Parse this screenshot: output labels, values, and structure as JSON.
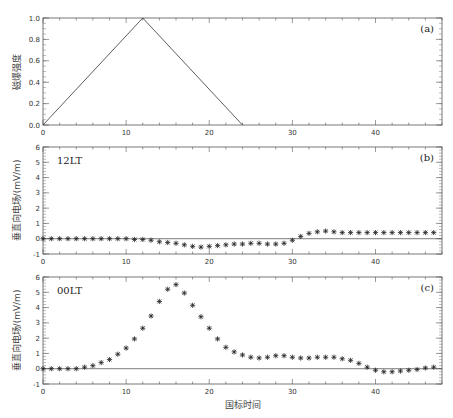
{
  "chart_data": [
    {
      "panel": "a",
      "type": "line",
      "tag": "(a)",
      "title": "",
      "xlabel": "",
      "ylabel": "磁爆强度",
      "xlim": [
        0,
        48
      ],
      "ylim": [
        0.0,
        1.0
      ],
      "xticks": [
        0,
        10,
        20,
        30,
        40
      ],
      "yticks": [
        "0.0",
        "0.2",
        "0.4",
        "0.6",
        "0.8",
        "1.0"
      ],
      "grid": false,
      "series": [
        {
          "name": "storm intensity",
          "x": [
            0,
            12,
            24
          ],
          "y": [
            0.0,
            1.0,
            0.0
          ]
        }
      ]
    },
    {
      "panel": "b",
      "type": "scatter",
      "tag": "(b)",
      "annotation": "12LT",
      "xlabel": "",
      "ylabel": "垂直向电场/(mV/m)",
      "xlim": [
        0,
        48
      ],
      "ylim": [
        -1,
        6
      ],
      "xticks": [
        0,
        10,
        20,
        30,
        40
      ],
      "yticks": [
        "-1",
        "0",
        "1",
        "2",
        "3",
        "4",
        "5",
        "6"
      ],
      "zero_line": true,
      "marker": "asterisk",
      "series": [
        {
          "name": "12LT",
          "x": [
            0,
            1,
            2,
            3,
            4,
            5,
            6,
            7,
            8,
            9,
            10,
            11,
            12,
            13,
            14,
            15,
            16,
            17,
            18,
            19,
            20,
            21,
            22,
            23,
            24,
            25,
            26,
            27,
            28,
            29,
            30,
            31,
            32,
            33,
            34,
            35,
            36,
            37,
            38,
            39,
            40,
            41,
            42,
            43,
            44,
            45,
            46,
            47
          ],
          "values": [
            0,
            0,
            0,
            0,
            0,
            0,
            0,
            0,
            0,
            0,
            0,
            -0.05,
            -0.05,
            -0.1,
            -0.2,
            -0.25,
            -0.3,
            -0.4,
            -0.5,
            -0.55,
            -0.5,
            -0.45,
            -0.4,
            -0.35,
            -0.35,
            -0.3,
            -0.3,
            -0.35,
            -0.35,
            -0.3,
            -0.1,
            0.15,
            0.35,
            0.45,
            0.5,
            0.45,
            0.4,
            0.4,
            0.4,
            0.4,
            0.4,
            0.4,
            0.4,
            0.4,
            0.4,
            0.4,
            0.4,
            0.4
          ]
        }
      ]
    },
    {
      "panel": "c",
      "type": "scatter",
      "tag": "(c)",
      "annotation": "00LT",
      "xlabel": "国标时间",
      "ylabel": "垂直向电场/(mV/m)",
      "xlim": [
        0,
        48
      ],
      "ylim": [
        -1,
        6
      ],
      "xticks": [
        0,
        10,
        20,
        30,
        40
      ],
      "yticks": [
        "-1",
        "0",
        "1",
        "2",
        "3",
        "4",
        "5",
        "6"
      ],
      "zero_line": true,
      "marker": "asterisk",
      "series": [
        {
          "name": "00LT",
          "x": [
            0,
            1,
            2,
            3,
            4,
            5,
            6,
            7,
            8,
            9,
            10,
            11,
            12,
            13,
            14,
            15,
            16,
            17,
            18,
            19,
            20,
            21,
            22,
            23,
            24,
            25,
            26,
            27,
            28,
            29,
            30,
            31,
            32,
            33,
            34,
            35,
            36,
            37,
            38,
            39,
            40,
            41,
            42,
            43,
            44,
            45,
            46,
            47
          ],
          "values": [
            0,
            0,
            0,
            0,
            0,
            0.1,
            0.2,
            0.4,
            0.6,
            0.95,
            1.35,
            1.95,
            2.65,
            3.45,
            4.4,
            5.2,
            5.5,
            4.95,
            4.15,
            3.4,
            2.65,
            1.95,
            1.4,
            1.1,
            0.9,
            0.75,
            0.7,
            0.75,
            0.85,
            0.85,
            0.75,
            0.7,
            0.7,
            0.75,
            0.75,
            0.75,
            0.65,
            0.55,
            0.35,
            0.1,
            -0.1,
            -0.2,
            -0.2,
            -0.15,
            -0.1,
            -0.05,
            0.05,
            0.1
          ]
        }
      ]
    }
  ]
}
